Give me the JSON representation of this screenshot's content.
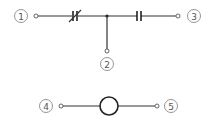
{
  "diagram": {
    "type": "circuit-schematic",
    "colors": {
      "wire": "#333333",
      "label_ring": "#8a8a8a",
      "label_text": "#555555",
      "background": "#ffffff"
    },
    "circuit_top": {
      "nodes": [
        {
          "id": "1",
          "label": "1"
        },
        {
          "id": "2",
          "label": "2"
        },
        {
          "id": "3",
          "label": "3"
        }
      ],
      "components": [
        {
          "name": "variable-capacitor",
          "between": [
            "1",
            "junction"
          ]
        },
        {
          "name": "fixed-capacitor",
          "between": [
            "junction",
            "3"
          ]
        }
      ],
      "junction": {
        "connects": [
          "1",
          "2",
          "3"
        ]
      }
    },
    "circuit_bottom": {
      "nodes": [
        {
          "id": "4",
          "label": "4"
        },
        {
          "id": "5",
          "label": "5"
        }
      ],
      "components": [
        {
          "name": "circle-element",
          "between": [
            "4",
            "5"
          ]
        }
      ]
    }
  }
}
